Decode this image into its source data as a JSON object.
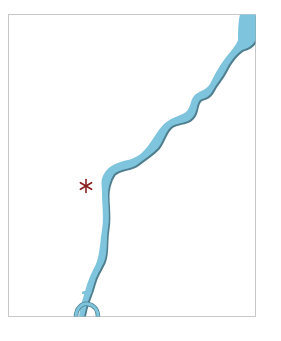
{
  "map": {
    "frame": {
      "x": 8.5,
      "y": 14.5,
      "width": 247,
      "height": 302,
      "stroke": "#c8c8c8"
    },
    "river": {
      "name": "river",
      "fill": "#7ec4dc",
      "shadow": "#4f7f8e"
    },
    "marker": {
      "symbol": "asterisk",
      "x": 86,
      "y": 186,
      "color": "#8b1e1e"
    }
  }
}
